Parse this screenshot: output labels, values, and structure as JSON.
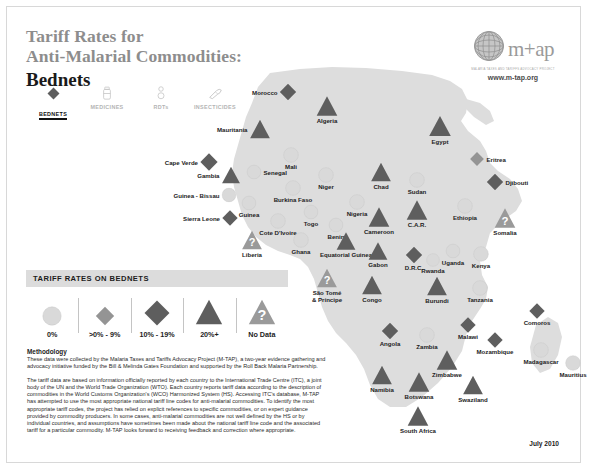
{
  "header": {
    "title_line1": "Tariff Rates for",
    "title_line2": "Anti-Malarial Commodities:",
    "subtitle": "Bednets"
  },
  "logo": {
    "wordmark": "m+ap",
    "tagline": "MALARIA TAXES AND TARIFFS ADVOCACY PROJECT",
    "url": "www.m-tap.org",
    "globe_icon": "globe-icon"
  },
  "commodity_tabs": [
    {
      "label": "BEDNETS",
      "icon": "bednet-icon",
      "active": true
    },
    {
      "label": "MEDICINES",
      "icon": "medicines-icon",
      "active": false
    },
    {
      "label": "RDTs",
      "icon": "rdt-icon",
      "active": false
    },
    {
      "label": "INSECTICIDES",
      "icon": "insecticide-icon",
      "active": false
    },
    {
      "label": "IRS PUMPS",
      "icon": "irs-pump-icon",
      "active": false
    }
  ],
  "legend": {
    "heading": "TARIFF RATES ON BEDNETS",
    "items": [
      {
        "label": "0%",
        "shape": "circle",
        "fill": "light"
      },
      {
        "label": ">0% - 9%",
        "shape": "diamond-small",
        "fill": "medium"
      },
      {
        "label": "10% - 19%",
        "shape": "diamond-large",
        "fill": "dark"
      },
      {
        "label": "20%+",
        "shape": "triangle",
        "fill": "dark"
      },
      {
        "label": "No Data",
        "shape": "triangle-question",
        "fill": "gray"
      }
    ]
  },
  "chart_data": {
    "type": "map",
    "title": "Tariff Rates on Bednets",
    "legend_position": "bottom-left",
    "categories": [
      "0%",
      ">0% - 9%",
      "10% - 19%",
      "20%+",
      "No Data"
    ],
    "countries": [
      {
        "name": "Morocco",
        "category": "10% - 19%",
        "shape": "diamond-large",
        "x": 138,
        "y": 37,
        "size": 17,
        "label_pos": "lft"
      },
      {
        "name": "Mauritania",
        "category": "20%+",
        "shape": "triangle",
        "x": 110,
        "y": 74,
        "size": 21,
        "label_pos": "lft"
      },
      {
        "name": "Cape Verde",
        "category": "10% - 19%",
        "shape": "diamond-large",
        "x": 59,
        "y": 107,
        "size": 18,
        "label_pos": "lft"
      },
      {
        "name": "Algeria",
        "category": "20%+",
        "shape": "triangle",
        "x": 177,
        "y": 51,
        "size": 22,
        "label_pos": "bot"
      },
      {
        "name": "Egypt",
        "category": "20%+",
        "shape": "triangle",
        "x": 290,
        "y": 71,
        "size": 23,
        "label_pos": "bot"
      },
      {
        "name": "Eritrea",
        "category": ">0% - 9%",
        "shape": "diamond-small",
        "x": 327,
        "y": 104,
        "size": 15,
        "label_pos": "rgt"
      },
      {
        "name": "Djibouti",
        "category": "10% - 19%",
        "shape": "diamond-large",
        "x": 345,
        "y": 127,
        "size": 17,
        "label_pos": "rgt"
      },
      {
        "name": "Sudan",
        "category": "0%",
        "shape": "circle",
        "x": 267,
        "y": 125,
        "size": 16,
        "label_pos": "bot"
      },
      {
        "name": "Chad",
        "category": "20%+",
        "shape": "triangle",
        "x": 231,
        "y": 117,
        "size": 21,
        "label_pos": "bot"
      },
      {
        "name": "Niger",
        "category": "0%",
        "shape": "circle",
        "x": 176,
        "y": 120,
        "size": 16,
        "label_pos": "bot"
      },
      {
        "name": "Mali",
        "category": "0%",
        "shape": "circle",
        "x": 141,
        "y": 100,
        "size": 16,
        "label_pos": "bot"
      },
      {
        "name": "Senegal",
        "category": "0%",
        "shape": "circle",
        "x": 104,
        "y": 117,
        "size": 15,
        "label_pos": "rgt"
      },
      {
        "name": "Gambia",
        "category": "20%+",
        "shape": "triangle",
        "x": 81,
        "y": 120,
        "size": 19,
        "label_pos": "lft"
      },
      {
        "name": "Guinea - Bissau",
        "category": "0%",
        "shape": "circle",
        "x": 79,
        "y": 140,
        "size": 15,
        "label_pos": "lft"
      },
      {
        "name": "Guinea",
        "category": "0%",
        "shape": "circle",
        "x": 99,
        "y": 148,
        "size": 15,
        "label_pos": "bot"
      },
      {
        "name": "Sierra Leone",
        "category": "10% - 19%",
        "shape": "diamond-large",
        "x": 80,
        "y": 163,
        "size": 16,
        "label_pos": "lft"
      },
      {
        "name": "Liberia",
        "category": "No Data",
        "shape": "triangle-question",
        "x": 102,
        "y": 185,
        "size": 21,
        "label_pos": "bot"
      },
      {
        "name": "Burkina Faso",
        "category": "0%",
        "shape": "circle",
        "x": 143,
        "y": 133,
        "size": 16,
        "label_pos": "bot"
      },
      {
        "name": "Cote D'Ivoire",
        "category": "0%",
        "shape": "circle",
        "x": 128,
        "y": 166,
        "size": 16,
        "label_pos": "bot"
      },
      {
        "name": "Ghana",
        "category": "0%",
        "shape": "circle",
        "x": 151,
        "y": 185,
        "size": 16,
        "label_pos": "bot"
      },
      {
        "name": "Togo",
        "category": "0%",
        "shape": "circle",
        "x": 161,
        "y": 157,
        "size": 15,
        "label_pos": "bot"
      },
      {
        "name": "Benin",
        "category": "0%",
        "shape": "circle",
        "x": 186,
        "y": 170,
        "size": 15,
        "label_pos": "bot"
      },
      {
        "name": "Nigeria",
        "category": "0%",
        "shape": "circle",
        "x": 207,
        "y": 147,
        "size": 16,
        "label_pos": "bot"
      },
      {
        "name": "Cameroon",
        "category": "20%+",
        "shape": "triangle",
        "x": 229,
        "y": 162,
        "size": 22,
        "label_pos": "bot"
      },
      {
        "name": "C.A.R.",
        "category": "20%+",
        "shape": "triangle",
        "x": 267,
        "y": 155,
        "size": 22,
        "label_pos": "bot"
      },
      {
        "name": "Equatorial Guinea",
        "category": "20%+",
        "shape": "triangle",
        "x": 196,
        "y": 186,
        "size": 20,
        "label_pos": "bot"
      },
      {
        "name": "Gabon",
        "category": "20%+",
        "shape": "triangle",
        "x": 228,
        "y": 196,
        "size": 20,
        "label_pos": "bot"
      },
      {
        "name": "Congo",
        "category": "20%+",
        "shape": "triangle",
        "x": 222,
        "y": 230,
        "size": 21,
        "label_pos": "bot"
      },
      {
        "name": "D.R.C.",
        "category": "10% - 19%",
        "shape": "diamond-large",
        "x": 264,
        "y": 200,
        "size": 17,
        "label_pos": "bot"
      },
      {
        "name": "São Tomé\n& Príncipe",
        "category": "No Data",
        "shape": "triangle-question",
        "x": 177,
        "y": 223,
        "size": 21,
        "label_pos": "bot"
      },
      {
        "name": "Ethiopia",
        "category": "0%",
        "shape": "circle",
        "x": 315,
        "y": 151,
        "size": 16,
        "label_pos": "bot"
      },
      {
        "name": "Somalia",
        "category": "No Data",
        "shape": "triangle-question",
        "x": 355,
        "y": 163,
        "size": 22,
        "label_pos": "bot"
      },
      {
        "name": "Uganda",
        "category": "0%",
        "shape": "circle",
        "x": 303,
        "y": 196,
        "size": 15,
        "label_pos": "bot"
      },
      {
        "name": "Rwanda",
        "category": "0%",
        "shape": "circle",
        "x": 283,
        "y": 205,
        "size": 14,
        "label_pos": "bot"
      },
      {
        "name": "Burundi",
        "category": "20%+",
        "shape": "triangle",
        "x": 287,
        "y": 231,
        "size": 21,
        "label_pos": "bot"
      },
      {
        "name": "Kenya",
        "category": "0%",
        "shape": "circle",
        "x": 331,
        "y": 199,
        "size": 16,
        "label_pos": "bot"
      },
      {
        "name": "Tanzania",
        "category": "0%",
        "shape": "circle",
        "x": 330,
        "y": 233,
        "size": 16,
        "label_pos": "bot"
      },
      {
        "name": "Angola",
        "category": "10% - 19%",
        "shape": "diamond-large",
        "x": 240,
        "y": 276,
        "size": 17,
        "label_pos": "bot"
      },
      {
        "name": "Zambia",
        "category": "0%",
        "shape": "circle",
        "x": 277,
        "y": 280,
        "size": 16,
        "label_pos": "bot"
      },
      {
        "name": "Malawi",
        "category": "10% - 19%",
        "shape": "diamond-large",
        "x": 318,
        "y": 270,
        "size": 16,
        "label_pos": "bot"
      },
      {
        "name": "Mozambique",
        "category": "10% - 19%",
        "shape": "diamond-large",
        "x": 345,
        "y": 285,
        "size": 16,
        "label_pos": "bot"
      },
      {
        "name": "Comoros",
        "category": "10% - 19%",
        "shape": "diamond-large",
        "x": 387,
        "y": 256,
        "size": 16,
        "label_pos": "bot"
      },
      {
        "name": "Madagascar",
        "category": "0%",
        "shape": "circle",
        "x": 391,
        "y": 295,
        "size": 16,
        "label_pos": "bot"
      },
      {
        "name": "Mauritius",
        "category": "0%",
        "shape": "circle",
        "x": 423,
        "y": 308,
        "size": 16,
        "label_pos": "bot"
      },
      {
        "name": "Zimbabwe",
        "category": "20%+",
        "shape": "triangle",
        "x": 297,
        "y": 305,
        "size": 22,
        "label_pos": "bot"
      },
      {
        "name": "Namibia",
        "category": "20%+",
        "shape": "triangle",
        "x": 232,
        "y": 320,
        "size": 21,
        "label_pos": "bot"
      },
      {
        "name": "Botswana",
        "category": "20%+",
        "shape": "triangle",
        "x": 269,
        "y": 327,
        "size": 22,
        "label_pos": "bot"
      },
      {
        "name": "Swaziland",
        "category": "20%+",
        "shape": "triangle",
        "x": 323,
        "y": 330,
        "size": 21,
        "label_pos": "bot"
      },
      {
        "name": "South Africa",
        "category": "20%+",
        "shape": "triangle",
        "x": 268,
        "y": 361,
        "size": 22,
        "label_pos": "bot"
      }
    ]
  },
  "methodology": {
    "heading": "Methodology",
    "paragraph1": "These data were collected by the Malaria Taxes and Tariffs Advocacy Project (M-TAP), a two-year evidence gathering and advocacy initiative funded by the Bill & Melinda Gates Foundation and supported by the Roll Back Malaria Partnership.",
    "paragraph2": "The tariff data are based on information officially reported by each country to the International Trade Centre (ITC), a joint body of the UN and the World Trade Organization (WTO). Each country reports tariff data according to the description of commodities in the World Customs Organization's (WCO) Harmonized System (HS). Accessing ITC's database, M-TAP has attempted to use the most appropriate national tariff line codes for anti-malarial commodities. To identify the most appropriate tariff codes, the project has relied on explicit references to specific commodities, or on expert guidance provided by commodity producers. In some cases, anti-malarial commodities are not well defined by the HS or by individual countries, and assumptions have sometimes been made about the national tariff line code and the associated tariff for a particular commodity. M-TAP looks forward to receiving feedback and correction where appropriate."
  },
  "footer": {
    "date": "July 2010"
  }
}
